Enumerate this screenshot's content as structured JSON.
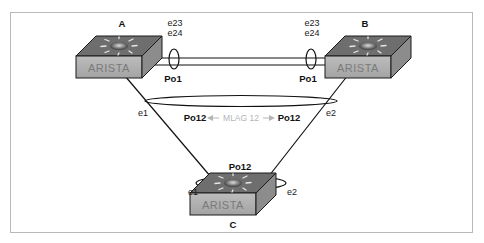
{
  "diagram": {
    "colors": {
      "frame": "#b8b8b8",
      "line": "#111111",
      "switch_top": "#6b6b6b",
      "switch_front": "#b0b0b0",
      "switch_side": "#8a8a8a",
      "mlag_text": "#b5b5b5"
    },
    "switches": [
      {
        "id": "A",
        "label": "A",
        "brand": "ARISTA",
        "icon": "network-switch-icon"
      },
      {
        "id": "B",
        "label": "B",
        "brand": "ARISTA",
        "icon": "network-switch-icon"
      },
      {
        "id": "C",
        "label": "C",
        "brand": "ARISTA",
        "icon": "network-switch-icon"
      }
    ],
    "peer_link": {
      "a_ports": [
        "e23",
        "e24"
      ],
      "b_ports": [
        "e23",
        "e24"
      ],
      "a_portchannel": "Po1",
      "b_portchannel": "Po1"
    },
    "mlag": {
      "a_portchannel": "Po12",
      "b_portchannel": "Po12",
      "name": "MLAG 12",
      "a_port": "e1",
      "b_port": "e2"
    },
    "downstream": {
      "portchannel": "Po12",
      "port_to_a": "e1",
      "port_to_b": "e2"
    }
  }
}
